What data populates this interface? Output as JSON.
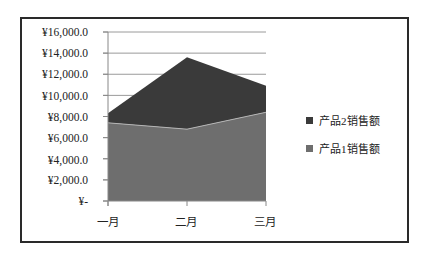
{
  "chart_data": {
    "type": "area",
    "stacked": true,
    "title": "",
    "xlabel": "",
    "ylabel": "",
    "categories": [
      "一月",
      "二月",
      "三月"
    ],
    "series": [
      {
        "name": "产品1销售额",
        "values": [
          7400,
          6800,
          8400
        ],
        "color": "#6e6e6e"
      },
      {
        "name": "产品2销售额",
        "values": [
          900,
          6800,
          2500
        ],
        "color": "#3a3a3a"
      }
    ],
    "stack_totals": [
      8300,
      13600,
      10900
    ],
    "ylim": [
      0,
      16000
    ],
    "y_ticks": [
      "¥16,000.0",
      "¥14,000.0",
      "¥12,000.0",
      "¥10,000.0",
      "¥8,000.0",
      "¥6,000.0",
      "¥4,000.0",
      "¥2,000.0",
      "¥-"
    ],
    "grid": true,
    "legend_position": "right",
    "legend": [
      "产品2销售额",
      "产品1销售额"
    ]
  },
  "legend": {
    "items": [
      {
        "label": "产品2销售额",
        "color": "#3a3a3a"
      },
      {
        "label": "产品1销售额",
        "color": "#6e6e6e"
      }
    ]
  }
}
